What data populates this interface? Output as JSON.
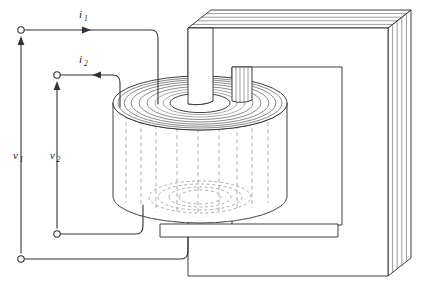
{
  "figure": {
    "type": "technical-line-diagram",
    "background_color": "#ffffff",
    "line_color": "#333333",
    "hidden_line_color": "#8a8a8a"
  },
  "labels": {
    "current_primary": {
      "base": "i",
      "sub": "1"
    },
    "current_secondary": {
      "base": "i",
      "sub": "2"
    },
    "voltage_primary": {
      "base": "v",
      "sub": "1"
    },
    "voltage_secondary": {
      "base": "v",
      "sub": "2"
    }
  },
  "terminals": [
    {
      "name": "primary-top",
      "x": 21,
      "y": 30
    },
    {
      "name": "secondary-top",
      "x": 57,
      "y": 75
    },
    {
      "name": "secondary-bottom",
      "x": 57,
      "y": 234
    },
    {
      "name": "primary-bottom",
      "x": 21,
      "y": 259
    }
  ],
  "arrows": {
    "current_primary_direction": "right",
    "current_secondary_direction": "left",
    "voltage_primary_direction": "up",
    "voltage_secondary_direction": "up"
  },
  "components": {
    "core": {
      "name": "laminated-iron-core",
      "lamination_count": 5,
      "shape": "rectangular-window"
    },
    "coil": {
      "name": "cylindrical-winding",
      "spiral_turns": 7,
      "hidden_detail": true
    }
  }
}
